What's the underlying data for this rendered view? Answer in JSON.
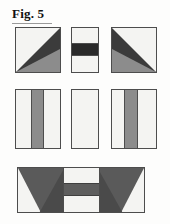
{
  "figure": {
    "caption": "Fig. 5",
    "kind": "patchwork-block-assembly-diagram",
    "background": "#fdfdfc",
    "outline_color": "#4d4d4d"
  },
  "palette": {
    "light": "#f4f4f2",
    "medium_gray": "#8c8c8c",
    "dark_gray": "#5a5a5a",
    "charcoal": "#3b3b3b",
    "black_band": "#2a2a2a"
  },
  "rows": [
    {
      "name": "row-1-geese-units",
      "units": [
        {
          "id": "goose-left",
          "label": "flying-geese square, dark wedge to right",
          "shape": "square",
          "fills": [
            "light",
            "charcoal",
            "medium_gray"
          ]
        },
        {
          "id": "center-strip",
          "label": "banded center rectangle",
          "shape": "rectangle",
          "fills": [
            "light",
            "black_band",
            "light"
          ]
        },
        {
          "id": "goose-right",
          "label": "flying-geese square, dark wedge to left",
          "shape": "square",
          "fills": [
            "light",
            "charcoal",
            "medium_gray"
          ]
        }
      ]
    },
    {
      "name": "row-2-sashing-units",
      "units": [
        {
          "id": "strip-left",
          "label": "rectangle with centered gray stripe",
          "shape": "rectangle",
          "stripe": "center"
        },
        {
          "id": "strip-mid",
          "label": "plain light rectangle",
          "shape": "rectangle",
          "stripe": "none"
        },
        {
          "id": "strip-right",
          "label": "rectangle with off-center gray stripe",
          "shape": "rectangle",
          "stripe": "off-left"
        }
      ]
    },
    {
      "name": "row-3-assembled-panel",
      "units": [
        {
          "id": "assembled-panel",
          "label": "assembled panel: mirrored wings flanking banded center",
          "shape": "wide-rectangle",
          "fills": [
            "light",
            "medium_gray",
            "dark_gray"
          ]
        }
      ]
    }
  ]
}
